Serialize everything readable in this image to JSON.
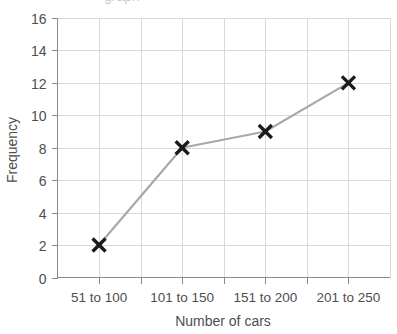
{
  "chart_data": {
    "type": "line",
    "title": "",
    "xlabel": "Number of cars",
    "ylabel": "Frequency",
    "categories": [
      "51 to 100",
      "101 to 150",
      "151 to 200",
      "201 to 250"
    ],
    "values": [
      2,
      8,
      9,
      12
    ],
    "series": [
      {
        "name": "Frequency",
        "values": [
          2,
          8,
          9,
          12
        ]
      }
    ],
    "ylim": [
      0,
      16
    ],
    "ytick_labels": [
      "0",
      "2",
      "4",
      "6",
      "8",
      "10",
      "12",
      "14",
      "16"
    ],
    "ytick_values": [
      0,
      2,
      4,
      6,
      8,
      10,
      12,
      14,
      16
    ],
    "ystep": 2,
    "grid": "horizontal-and-vertical",
    "legend": "none",
    "marker": "x-cross",
    "colors": {
      "line": "#a9a9a9",
      "marker": "#1a1a1a",
      "gridline": "#d9d9d9",
      "axis": "#8a8a8a",
      "text": "#4e4e4e",
      "background": "#ffffff"
    },
    "x_divisions": 8,
    "point_x_divisions": [
      1,
      3,
      5,
      7
    ]
  },
  "cropped_header": {
    "text": "graph"
  }
}
